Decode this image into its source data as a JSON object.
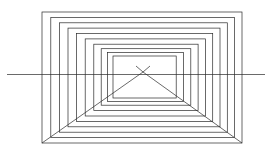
{
  "figure": {
    "type": "line-drawing",
    "canvas": {
      "width": 272,
      "height": 160,
      "background": "#ffffff"
    },
    "stroke": {
      "color": "#2a2a2a",
      "width": 0.7
    },
    "vanishing_point": {
      "x": 143,
      "y": 72
    },
    "horizon_line": {
      "x1": 7,
      "y1": 74.5,
      "x2": 265,
      "y2": 74.5
    },
    "outer_rectangle": {
      "left": 42,
      "top": 12,
      "right": 242,
      "bottom": 143
    },
    "inner_rectangle": {
      "left": 113,
      "top": 56,
      "right": 176,
      "bottom": 98
    },
    "rectangle_count": 10,
    "rectangles": [
      {
        "left": 42,
        "top": 12,
        "right": 242,
        "bottom": 143
      },
      {
        "left": 50.8,
        "top": 17.4,
        "right": 234.6,
        "bottom": 137.6
      },
      {
        "left": 59.4,
        "top": 22.8,
        "right": 227.3,
        "bottom": 132.2
      },
      {
        "left": 68.0,
        "top": 28.1,
        "right": 220.0,
        "bottom": 126.8
      },
      {
        "left": 76.6,
        "top": 33.5,
        "right": 212.7,
        "bottom": 121.4
      },
      {
        "left": 85.2,
        "top": 38.9,
        "right": 205.4,
        "bottom": 116.0
      },
      {
        "left": 93.8,
        "top": 44.2,
        "right": 198.1,
        "bottom": 110.6
      },
      {
        "left": 101.2,
        "top": 48.7,
        "right": 190.8,
        "bottom": 105.2
      },
      {
        "left": 107.5,
        "top": 52.5,
        "right": 183.5,
        "bottom": 101.5
      },
      {
        "left": 113.0,
        "top": 56.0,
        "right": 176.2,
        "bottom": 98.0
      }
    ],
    "diagonals": [
      {
        "name": "vp-to-bottom-left",
        "x1": 143,
        "y1": 72,
        "x2": 42,
        "y2": 143
      },
      {
        "name": "vp-to-bottom-right",
        "x1": 143,
        "y1": 72,
        "x2": 242,
        "y2": 143
      },
      {
        "name": "vp-to-top-left",
        "x1": 143,
        "y1": 72,
        "x2": 136,
        "y2": 66
      },
      {
        "name": "vp-to-top-right",
        "x1": 143,
        "y1": 72,
        "x2": 150,
        "y2": 66
      }
    ]
  }
}
